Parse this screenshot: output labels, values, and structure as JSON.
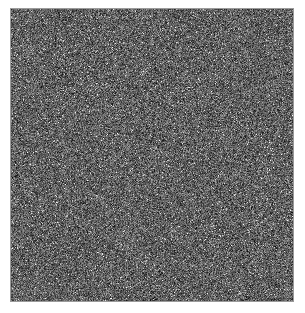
{
  "image": {
    "description": "grayscale random noise field",
    "noise": {
      "width": 282,
      "height": 292,
      "mean_gray": 95,
      "spread": 80,
      "seed": 12345
    },
    "colors": {
      "background": "#ffffff",
      "border": "#9a9a9a"
    }
  }
}
